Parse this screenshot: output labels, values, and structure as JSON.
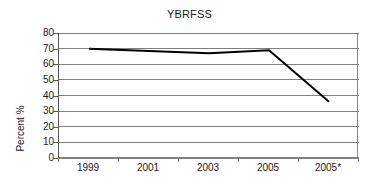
{
  "chart_data": {
    "type": "line",
    "title": "YBRFSS",
    "xlabel": "",
    "ylabel": "Percent %",
    "categories": [
      "1999",
      "2001",
      "2003",
      "2005",
      "2005*"
    ],
    "values": [
      70,
      68.5,
      67,
      69,
      36
    ],
    "series": [
      {
        "name": "YBRFSS",
        "values": [
          70,
          68.5,
          67,
          69,
          36
        ],
        "color": "#000000",
        "markers": false,
        "line_width": 2
      }
    ],
    "ylim": [
      0,
      80
    ],
    "ytick_values": [
      0,
      10,
      20,
      30,
      40,
      50,
      60,
      70,
      80
    ],
    "ytick_labels": [
      "0",
      "10",
      "20",
      "30",
      "40",
      "50",
      "60",
      "70",
      "80"
    ],
    "grid": "horizontal",
    "grid_color": "#808080",
    "legend": "none",
    "background": "#ffffff",
    "frame": "left-right",
    "footnote": ""
  }
}
